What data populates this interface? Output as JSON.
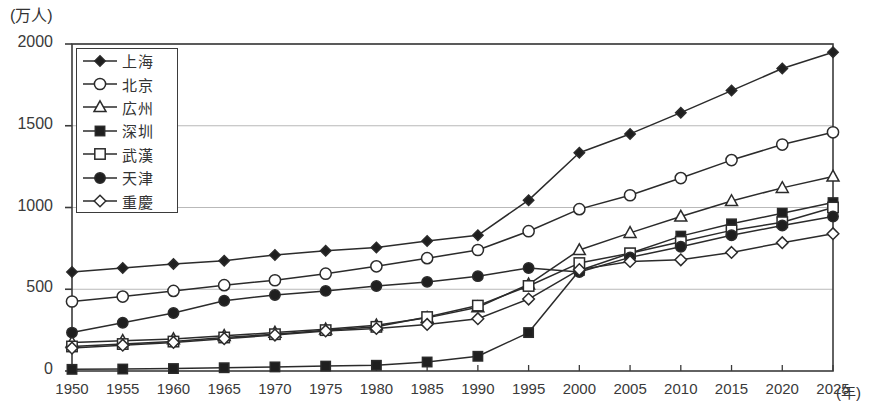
{
  "chart_data": {
    "type": "line",
    "title": "",
    "xlabel": "(年)",
    "ylabel": "(万人)",
    "unit_y": "(万人)",
    "unit_x": "(年)",
    "x": [
      1950,
      1955,
      1960,
      1965,
      1970,
      1975,
      1980,
      1985,
      1990,
      1995,
      2000,
      2005,
      2010,
      2015,
      2020,
      2025
    ],
    "xtick_labels": [
      "1950",
      "1955",
      "1960",
      "1965",
      "1970",
      "1975",
      "1980",
      "1985",
      "1990",
      "1995",
      "2000",
      "2005",
      "2010",
      "2015",
      "2020",
      "2025"
    ],
    "ytick_labels": [
      "0",
      "500",
      "1000",
      "1500",
      "2000"
    ],
    "yticks": [
      0,
      500,
      1000,
      1500,
      2000
    ],
    "ylim": [
      0,
      2000
    ],
    "xlim": [
      1950,
      2025
    ],
    "grid": "horizontal",
    "legend_position": "upper-left-inside",
    "series": [
      {
        "name": "上海",
        "marker": "filled-diamond",
        "values": [
          605,
          630,
          655,
          675,
          710,
          735,
          755,
          795,
          830,
          1045,
          1335,
          1450,
          1580,
          1715,
          1850,
          1950
        ]
      },
      {
        "name": "北京",
        "marker": "open-circle",
        "values": [
          425,
          455,
          490,
          525,
          555,
          595,
          640,
          690,
          740,
          855,
          990,
          1075,
          1180,
          1290,
          1385,
          1460
        ]
      },
      {
        "name": "広州",
        "marker": "open-triangle",
        "values": [
          175,
          185,
          195,
          215,
          235,
          255,
          280,
          325,
          390,
          530,
          740,
          845,
          945,
          1040,
          1120,
          1190
        ]
      },
      {
        "name": "深圳",
        "marker": "filled-square",
        "values": [
          10,
          12,
          15,
          20,
          25,
          30,
          35,
          55,
          90,
          235,
          615,
          720,
          825,
          900,
          965,
          1030
        ]
      },
      {
        "name": "武漢",
        "marker": "open-square",
        "values": [
          150,
          165,
          180,
          205,
          225,
          250,
          270,
          330,
          400,
          520,
          660,
          720,
          790,
          860,
          910,
          1000
        ]
      },
      {
        "name": "天津",
        "marker": "filled-circle",
        "values": [
          235,
          295,
          355,
          430,
          465,
          490,
          520,
          545,
          580,
          630,
          605,
          695,
          760,
          830,
          890,
          945
        ]
      },
      {
        "name": "重慶",
        "marker": "open-diamond",
        "values": [
          140,
          158,
          175,
          198,
          220,
          245,
          260,
          285,
          320,
          440,
          620,
          670,
          680,
          725,
          785,
          840
        ]
      }
    ]
  },
  "bottom_cut_text": ""
}
